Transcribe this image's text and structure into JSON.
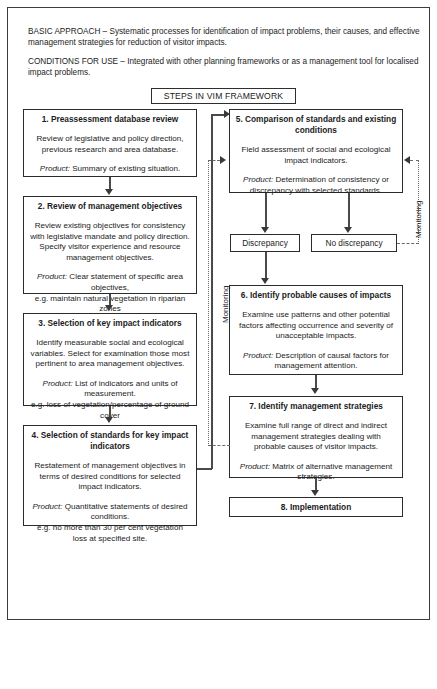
{
  "figure": {
    "intro": {
      "basic_approach_label": "BASIC APPROACH",
      "basic_approach_text": "BASIC APPROACH – Systematic processes for identification of impact problems, their causes, and effective management strategies for reduction of visitor impacts.",
      "conditions_label": "CONDITIONS FOR USE",
      "conditions_text": "CONDITIONS FOR USE – Integrated with other planning frameworks or as a management tool for localised impact problems."
    },
    "banner": {
      "label": "STEPS IN VIM FRAMEWORK"
    },
    "colors": {
      "border": "#2b2b2b",
      "connector": "#4a4a4a",
      "dashed_connector": "#6a6a6a",
      "background": "#ffffff",
      "text": "#1c1c1c"
    },
    "steps": [
      {
        "id": "step1",
        "title": "1. Preassessment database review",
        "body": "Review of legislative and policy direction, previous research and area database.",
        "product": "Product: Summary of existing situation.",
        "product_label": "Product:",
        "product_text": " Summary of existing situation.",
        "eg": ""
      },
      {
        "id": "step2",
        "title": "2. Review of management objectives",
        "body": "Review existing objectives for consistency with legislative mandate and policy direction. Specify visitor experience and resource management objectives.",
        "product_label": "Product:",
        "product_text": " Clear statement of specific area objectives,",
        "eg": "e.g. maintain natural vegetation in riparian zones"
      },
      {
        "id": "step3",
        "title": "3. Selection of key impact indicators",
        "body": "Identify measurable social and ecological variables. Select for examination those most pertinent to area management objectives.",
        "product_label": "Product:",
        "product_text": " List of indicators and units of measurement.",
        "eg": "e.g. loss of vegetation/percentage of ground cover"
      },
      {
        "id": "step4",
        "title": "4. Selection of standards for key impact indicators",
        "body": "Restatement of management objectives in terms of desired conditions for selected impact indicators.",
        "product_label": "Product:",
        "product_text": " Quantitative statements of desired conditions.",
        "eg": "e.g. no more than 30 per cent vegetation loss at specified site."
      },
      {
        "id": "step5",
        "title": "5. Comparison of standards and existing conditions",
        "body": "Field assessment of social and ecological impact indicators.",
        "product_label": "Product:",
        "product_text": " Determination of consistency or discrepancy with selected standards.",
        "eg": ""
      },
      {
        "id": "step6",
        "title": "6. Identify probable causes of impacts",
        "body": "Examine use patterns and other potential factors affecting occurrence and severity of unacceptable impacts.",
        "product_label": "Product:",
        "product_text": " Description of causal factors for management attention.",
        "eg": ""
      },
      {
        "id": "step7",
        "title": "7. Identify management strategies",
        "body": "Examine full range of direct and indirect management strategies dealing with probable causes of visitor impacts.",
        "product_label": "Product:",
        "product_text": " Matrix of alternative management strategies.",
        "eg": ""
      }
    ],
    "decisions": {
      "discrepancy": "Discrepancy",
      "no_discrepancy": "No discrepancy"
    },
    "terminal": {
      "implementation": "8. Implementation"
    },
    "monitoring": {
      "left_label": "Monitoring",
      "right_label": "Monitoring"
    }
  }
}
